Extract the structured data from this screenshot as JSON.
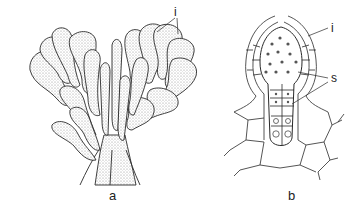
{
  "figure": {
    "panels": [
      {
        "id": "a",
        "caption": "a",
        "subject": "branched thallus cluster (stippled line drawing)",
        "labels": [
          {
            "text": "i"
          }
        ]
      },
      {
        "id": "b",
        "caption": "b",
        "subject": "longitudinal cellular section",
        "labels": [
          {
            "text": "i"
          },
          {
            "text": "s"
          }
        ]
      }
    ],
    "colors": {
      "ink": "#222222",
      "stipple": "#9a9a9a",
      "background": "#ffffff"
    }
  }
}
